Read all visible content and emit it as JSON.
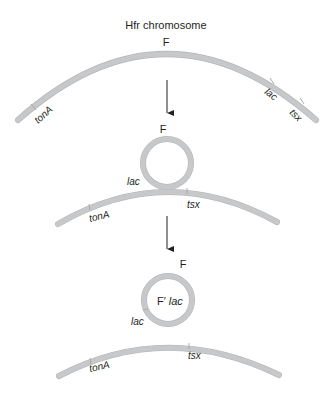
{
  "title": "Hfr chromosome",
  "panels": [
    {
      "id": "hfr",
      "labels": {
        "f": "F",
        "tonA": "tonA",
        "lac": "lac",
        "tsx": "tsx"
      }
    },
    {
      "id": "loop-out",
      "labels": {
        "f": "F",
        "lac": "lac",
        "tonA": "tonA",
        "tsx": "tsx"
      }
    },
    {
      "id": "f-prime",
      "labels": {
        "f": "F",
        "plasmid": "F′",
        "plasmid_gene": "lac",
        "lac": "lac",
        "tonA": "tonA",
        "tsx": "tsx"
      }
    }
  ],
  "colors": {
    "strand": "#c7c8ca",
    "text": "#231f20",
    "arrow": "#231f20"
  }
}
